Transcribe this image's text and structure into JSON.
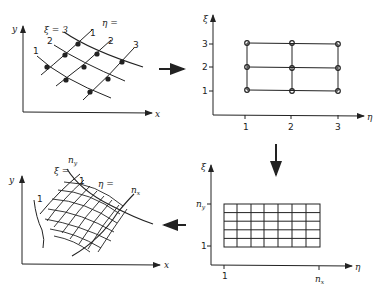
{
  "panels": {
    "physical_discrete": {
      "axis_x": "x",
      "axis_y": "y",
      "xi_label": "ξ = 3",
      "eta_label": "η =",
      "xi_ticks": [
        "1",
        "2"
      ],
      "eta_ticks": [
        "1",
        "2",
        "3"
      ]
    },
    "computational_discrete": {
      "axis_x": "η",
      "axis_y": "ξ",
      "x_ticks": [
        "1",
        "2",
        "3"
      ],
      "y_ticks": [
        "1",
        "2",
        "3"
      ]
    },
    "computational_grid": {
      "axis_x": "η",
      "axis_y": "ξ",
      "x_ticks": [
        "1",
        "n"
      ],
      "x_end_sub": "x",
      "y_ticks": [
        "1",
        "n"
      ],
      "y_end_sub": "y",
      "columns": 7,
      "rows": 5
    },
    "physical_grid": {
      "axis_x": "x",
      "axis_y": "y",
      "xi_label": "ξ =",
      "eta_label": "η =",
      "label_1a": "1",
      "label_1b": "1",
      "label_ny": "n",
      "label_ny_sub": "y",
      "label_nx": "n",
      "label_nx_sub": "x"
    }
  },
  "arrows": [
    "right",
    "down",
    "left"
  ]
}
